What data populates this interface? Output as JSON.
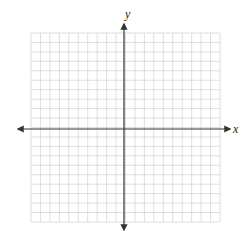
{
  "diagram": {
    "type": "coordinate-plane",
    "x_axis_label": "x",
    "y_axis_label": "y",
    "grid": {
      "left": 31,
      "top": 33,
      "right": 220,
      "bottom": 222,
      "cols": 20,
      "rows": 20
    },
    "origin": {
      "x": 124,
      "y": 129
    },
    "x_axis": {
      "start": 18,
      "end": 230
    },
    "y_axis": {
      "start": 24,
      "end": 230
    },
    "colors": {
      "grid_line": "#d6d6d6",
      "axis_line": "#333333",
      "label": "#222222",
      "background": "#ffffff"
    }
  }
}
